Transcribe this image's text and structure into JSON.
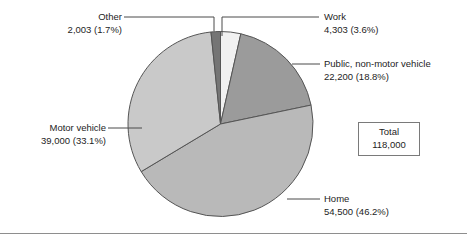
{
  "chart_data": {
    "type": "pie",
    "title": "",
    "subtitle": "",
    "xlabel": "",
    "ylabel": "",
    "legend_position": "callout-labels",
    "grid": false,
    "total_label": "Total",
    "total_value": "118,000",
    "total_numeric": 118000,
    "start_angle_deg": 0,
    "direction": "clockwise",
    "categories": [
      "Work",
      "Public, non-motor vehicle",
      "Home",
      "Motor vehicle",
      "Other"
    ],
    "values": [
      4303,
      22200,
      54500,
      39000,
      2003
    ],
    "percents": [
      3.6,
      18.8,
      46.2,
      33.1,
      1.7
    ],
    "slices": [
      {
        "name": "Work",
        "value": 4303,
        "value_label": "4,303",
        "percent": 3.6,
        "percent_label": "(3.6%)",
        "amount_line": "4,303 (3.6%)",
        "color": "#f1f1f1"
      },
      {
        "name": "Public, non-motor vehicle",
        "value": 22200,
        "value_label": "22,200",
        "percent": 18.8,
        "percent_label": "(18.8%)",
        "amount_line": "22,200 (18.8%)",
        "color": "#9b9b9b"
      },
      {
        "name": "Home",
        "value": 54500,
        "value_label": "54,500",
        "percent": 46.2,
        "percent_label": "(46.2%)",
        "amount_line": "54,500 (46.2%)",
        "color": "#b9b9b9"
      },
      {
        "name": "Motor vehicle",
        "value": 39000,
        "value_label": "39,000",
        "percent": 33.1,
        "percent_label": "(33.1%)",
        "amount_line": "39,000 (33.1%)",
        "color": "#c9c9c9"
      },
      {
        "name": "Other",
        "value": 2003,
        "value_label": "2,003",
        "percent": 1.7,
        "percent_label": "(1.7%)",
        "amount_line": "2,003 (1.7%)",
        "color": "#757575"
      }
    ]
  },
  "labels": {
    "other": {
      "name": "Other",
      "amount": "2,003 (1.7%)"
    },
    "work": {
      "name": "Work",
      "amount": "4,303 (3.6%)"
    },
    "public": {
      "name": "Public, non-motor vehicle",
      "amount": "22,200 (18.8%)"
    },
    "motor": {
      "name": "Motor vehicle",
      "amount": "39,000 (33.1%)"
    },
    "home": {
      "name": "Home",
      "amount": "54,500 (46.2%)"
    }
  },
  "total_box": {
    "label": "Total",
    "value": "118,000"
  },
  "colors": {
    "outline": "#555555",
    "leader": "#4a4a4a",
    "rule": "#8e8e8e",
    "text": "#1d1d1d"
  }
}
